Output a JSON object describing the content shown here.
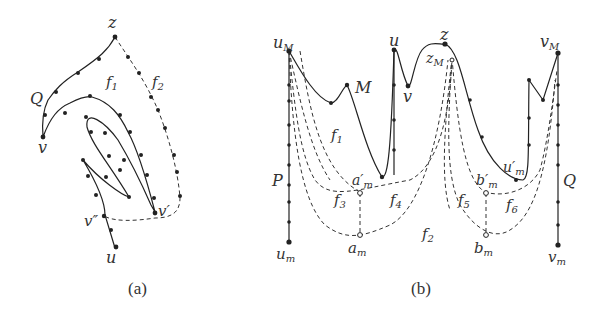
{
  "figure": {
    "panels": [
      {
        "id": "a",
        "caption": "(a)",
        "labels": {
          "z": "z",
          "Q": "Q",
          "f1": "f",
          "f1_sub": "1",
          "f2": "f",
          "f2_sub": "2",
          "v": "v",
          "v_prime": "v′",
          "v_dprime": "v″",
          "u": "u"
        }
      },
      {
        "id": "b",
        "caption": "(b)",
        "labels": {
          "uM": "u",
          "uM_sub": "M",
          "u": "u",
          "z": "z",
          "zM": "z",
          "zM_sub": "M",
          "vM": "v",
          "vM_sub": "M",
          "M": "M",
          "v": "v",
          "f1": "f",
          "f1_sub": "1",
          "P": "P",
          "Q": "Q",
          "a_m_prime": "a′",
          "a_m_prime_sub": "m",
          "b_m_prime": "b′",
          "b_m_prime_sub": "m",
          "u_m_prime": "u′",
          "u_m_prime_sub": "m",
          "f3": "f",
          "f3_sub": "3",
          "f4": "f",
          "f4_sub": "4",
          "f5": "f",
          "f5_sub": "5",
          "f6": "f",
          "f6_sub": "6",
          "f2": "f",
          "f2_sub": "2",
          "a_m": "a",
          "a_m_sub": "m",
          "b_m": "b",
          "b_m_sub": "m",
          "u_m": "u",
          "u_m_sub": "m",
          "v_m": "v",
          "v_m_sub": "m"
        }
      }
    ]
  }
}
